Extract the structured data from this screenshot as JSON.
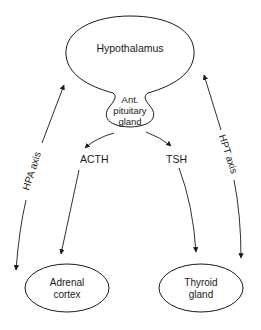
{
  "diagram": {
    "colors": {
      "stroke": "#1a1a1a",
      "text": "#1a1a1a",
      "background": "#ffffff"
    },
    "nodes": {
      "hypothalamus": {
        "label": "Hypothalamus"
      },
      "pituitary": {
        "line1": "Ant.",
        "line2": "pituitary",
        "line3": "gland"
      },
      "adrenal": {
        "line1": "Adrenal",
        "line2": "cortex"
      },
      "thyroid": {
        "line1": "Thyroid",
        "line2": "gland"
      }
    },
    "hormones": {
      "acth": "ACTH",
      "tsh": "TSH"
    },
    "axes": {
      "hpa": "HPA axis",
      "hpt": "HPT axis"
    },
    "edges": [
      {
        "from": "pituitary",
        "to": "ACTH"
      },
      {
        "from": "pituitary",
        "to": "TSH"
      },
      {
        "from": "ACTH",
        "to": "adrenal"
      },
      {
        "from": "TSH",
        "to": "thyroid"
      },
      {
        "between": [
          "hypothalamus",
          "adrenal"
        ],
        "label": "HPA axis",
        "bidirectional": true
      },
      {
        "between": [
          "hypothalamus",
          "thyroid"
        ],
        "label": "HPT axis",
        "bidirectional": true
      }
    ]
  }
}
